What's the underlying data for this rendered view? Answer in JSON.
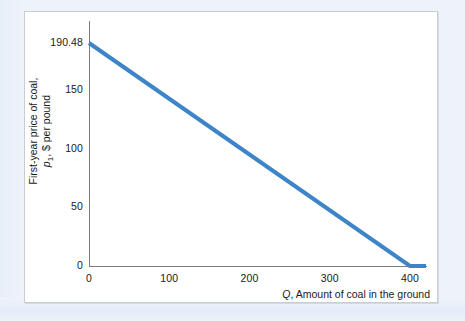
{
  "figure": {
    "background_color": "#eef3fa",
    "plate_color": "#ffffff",
    "plate_border_color": "#c9cdd2",
    "axis_color": "#7c7c7c",
    "series_color": "#3d85c8"
  },
  "axis_titles": {
    "y_line1": "First-year price of coal,",
    "y_line2_symbol": "p",
    "y_line2_subscript": "1",
    "y_line2_rest": ", $ per pound",
    "x_symbol": "Q",
    "x_rest": ", Amount of coal in the ground"
  },
  "chart_data": {
    "type": "line",
    "title": "",
    "subtitle": "",
    "xlabel": "Q, Amount of coal in the ground",
    "ylabel": "First-year price of coal, p1, $ per pound",
    "xlim": [
      0,
      420
    ],
    "ylim": [
      0,
      190.48
    ],
    "grid": false,
    "legend": "none",
    "x_ticks": [
      0,
      100,
      200,
      300,
      400
    ],
    "x_tick_labels": [
      "0",
      "100",
      "200",
      "300",
      "400"
    ],
    "y_ticks": [
      0,
      50,
      100,
      150,
      190.48
    ],
    "y_tick_labels": [
      "0",
      "50",
      "100",
      "150",
      "190.48"
    ],
    "series": [
      {
        "name": "First-year price of coal",
        "color": "#3d85c8",
        "line_width": 4,
        "x": [
          0,
          400,
          420
        ],
        "y": [
          190.48,
          0,
          0
        ],
        "annotations": [
          {
            "text": "intercept at p1 = 190.48 when Q = 0"
          },
          {
            "text": "reaches p1 = 0 at Q = 400, then flat"
          }
        ]
      }
    ]
  }
}
